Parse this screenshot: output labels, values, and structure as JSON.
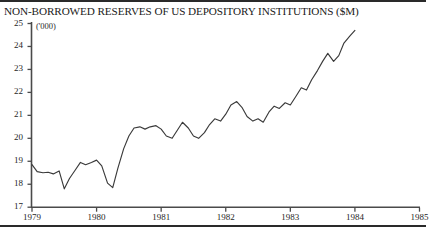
{
  "chart_data": {
    "type": "line",
    "title": "NON-BORROWED RESERVES OF US DEPOSITORY INSTITUTIONS ($M)",
    "subtitle": "('000)",
    "xlabel": "",
    "ylabel": "",
    "units_note": "('000)",
    "grid": false,
    "legend": null,
    "xlim": [
      1979,
      1985
    ],
    "ylim": [
      17,
      25
    ],
    "yticks": [
      17,
      18,
      19,
      20,
      21,
      22,
      23,
      24,
      25
    ],
    "ytick_labels": [
      "17",
      "18",
      "19",
      "20",
      "21",
      "22",
      "23",
      "24",
      "25"
    ],
    "xticks": [
      1979,
      1980,
      1981,
      1982,
      1983,
      1984,
      1985
    ],
    "xtick_labels": [
      "1979",
      "1980",
      "1981",
      "1982",
      "1983",
      "1984",
      "1985"
    ],
    "line_color": "#3a3a3a",
    "series": [
      {
        "name": "Non-borrowed reserves",
        "x": [
          1979.0,
          1979.08,
          1979.17,
          1979.25,
          1979.33,
          1979.42,
          1979.5,
          1979.58,
          1979.67,
          1979.75,
          1979.83,
          1979.92,
          1980.0,
          1980.08,
          1980.17,
          1980.25,
          1980.33,
          1980.42,
          1980.5,
          1980.58,
          1980.67,
          1980.75,
          1980.83,
          1980.92,
          1981.0,
          1981.08,
          1981.17,
          1981.25,
          1981.33,
          1981.42,
          1981.5,
          1981.58,
          1981.67,
          1981.75,
          1981.83,
          1981.92,
          1982.0,
          1982.08,
          1982.17,
          1982.25,
          1982.33,
          1982.42,
          1982.5,
          1982.58,
          1982.67,
          1982.75,
          1982.83,
          1982.92,
          1983.0,
          1983.08,
          1983.17,
          1983.25,
          1983.33,
          1983.42,
          1983.5,
          1983.58,
          1983.67,
          1983.75,
          1983.83,
          1983.92,
          1984.0
        ],
        "values": [
          18.85,
          18.55,
          18.5,
          18.52,
          18.45,
          18.58,
          17.8,
          18.25,
          18.62,
          18.95,
          18.85,
          18.95,
          19.05,
          18.8,
          18.05,
          17.85,
          18.7,
          19.55,
          20.1,
          20.45,
          20.5,
          20.4,
          20.5,
          20.55,
          20.4,
          20.1,
          20.0,
          20.35,
          20.7,
          20.45,
          20.1,
          20.0,
          20.25,
          20.6,
          20.85,
          20.75,
          21.05,
          21.45,
          21.6,
          21.35,
          20.95,
          20.75,
          20.85,
          20.7,
          21.15,
          21.4,
          21.3,
          21.55,
          21.45,
          21.8,
          22.2,
          22.1,
          22.55,
          22.95,
          23.35,
          23.7,
          23.35,
          23.6,
          24.15,
          24.45,
          24.7
        ]
      }
    ]
  },
  "axis": {
    "y_axis_name": "y-axis",
    "x_axis_name": "x-axis"
  }
}
